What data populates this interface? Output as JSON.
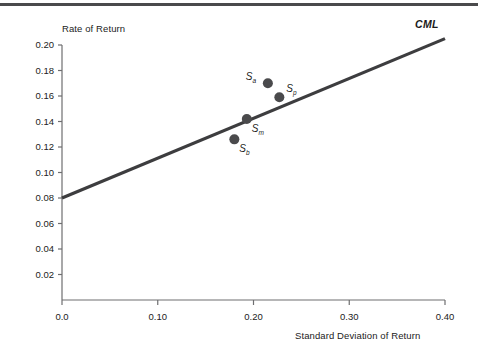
{
  "chart_data": {
    "type": "scatter",
    "title": "",
    "xlabel": "Standard Deviation of Return",
    "ylabel": "Rate of Return",
    "xlim": [
      0.0,
      0.4
    ],
    "ylim": [
      0.0,
      0.2
    ],
    "grid": false,
    "legend": "none",
    "xticks": [
      "0.0",
      "0.10",
      "0.20",
      "0.30",
      "0.40"
    ],
    "xtick_values": [
      0.0,
      0.1,
      0.2,
      0.3,
      0.4
    ],
    "yticks": [
      "0.02",
      "0.04",
      "0.06",
      "0.08",
      "0.10",
      "0.12",
      "0.14",
      "0.16",
      "0.18",
      "0.20"
    ],
    "ytick_values": [
      0.02,
      0.04,
      0.06,
      0.08,
      0.1,
      0.12,
      0.14,
      0.16,
      0.18,
      0.2
    ],
    "series": [
      {
        "name": "CML",
        "type": "line",
        "label": "CML",
        "color": "#3d3d3f",
        "x": [
          0.0,
          0.4
        ],
        "values": [
          0.08,
          0.205
        ],
        "intercept": 0.08,
        "slope": 0.3125
      },
      {
        "name": "portfolios",
        "type": "scatter",
        "color": "#4a4a4c",
        "points": [
          {
            "label": "S",
            "sub": "a",
            "x": 0.215,
            "y": 0.17,
            "label_pos": "left"
          },
          {
            "label": "S",
            "sub": "p",
            "x": 0.227,
            "y": 0.159,
            "label_pos": "right"
          },
          {
            "label": "S",
            "sub": "m",
            "x": 0.193,
            "y": 0.142,
            "label_pos": "below-right"
          },
          {
            "label": "S",
            "sub": "b",
            "x": 0.18,
            "y": 0.126,
            "label_pos": "below-right"
          }
        ]
      }
    ],
    "annotations": [
      {
        "text": "CML",
        "x": 0.395,
        "y": 0.207
      }
    ]
  },
  "axes": {
    "y_title": "Rate of Return",
    "x_title": "Standard Deviation of Return"
  },
  "colors": {
    "line": "#3d3d3f",
    "marker": "#4a4a4c",
    "axis": "#6e6e70",
    "rule": "#4a4a4c",
    "text": "#1a1a1a"
  }
}
